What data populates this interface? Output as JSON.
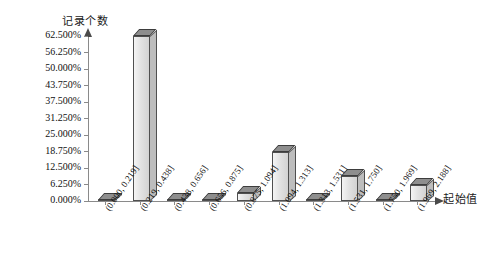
{
  "chart_data": {
    "type": "bar",
    "title": "",
    "subtitle": "",
    "xlabel": "起始值",
    "ylabel": "记录个数",
    "grid": false,
    "legend": false,
    "ylim": [
      0,
      62.5
    ],
    "ytick_labels": [
      "62.500%",
      "56.250%",
      "50.000%",
      "43.750%",
      "37.500%",
      "31.250%",
      "25.000%",
      "18.750%",
      "12.500%",
      "6.250%",
      "0.000%"
    ],
    "ytick_values": [
      62.5,
      56.25,
      50.0,
      43.75,
      37.5,
      31.25,
      25.0,
      18.75,
      12.5,
      6.25,
      0.0
    ],
    "categories": [
      "(0.000, 0.219]",
      "(0.219, 0.438]",
      "(0.438, 0.656]",
      "(0.656, 0.875]",
      "(0.875, 1.094]",
      "(1.094, 1.313]",
      "(1.313, 1.531]",
      "(1.531, 1.750]",
      "(1.750, 1.969]",
      "(1.969, 2.188]"
    ],
    "values": [
      0,
      62.5,
      0,
      0,
      3.125,
      18.75,
      0,
      9.375,
      0,
      6.25
    ],
    "value_unit": "%",
    "bar_style": "3d-extruded",
    "colors": {
      "bar_front": "#e2e2e2",
      "bar_top": "#8e8e8e",
      "bar_side": "#bdbdbd",
      "bar_outline": "#4f4f4f",
      "axis": "#8a8a8a",
      "text": "#111111",
      "background": "#ffffff"
    }
  }
}
